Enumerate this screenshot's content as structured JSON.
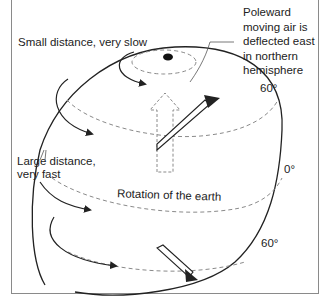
{
  "diagram": {
    "title_labels": {
      "small": "Small distance, very slow",
      "large_line1": "Large distance,",
      "large_line2": "very fast",
      "poleward_lines": [
        "Poleward",
        "moving air is",
        "deflected east",
        "in northern",
        "hemisphere"
      ],
      "rotation": "Rotation of the earth",
      "lat_60_north": "60°",
      "lat_0": "0°",
      "lat_60_south": "60°"
    },
    "colors": {
      "line": "#222222",
      "dashed": "#8a8a8a",
      "frame": "#8a8a8a",
      "background": "#ffffff"
    }
  }
}
